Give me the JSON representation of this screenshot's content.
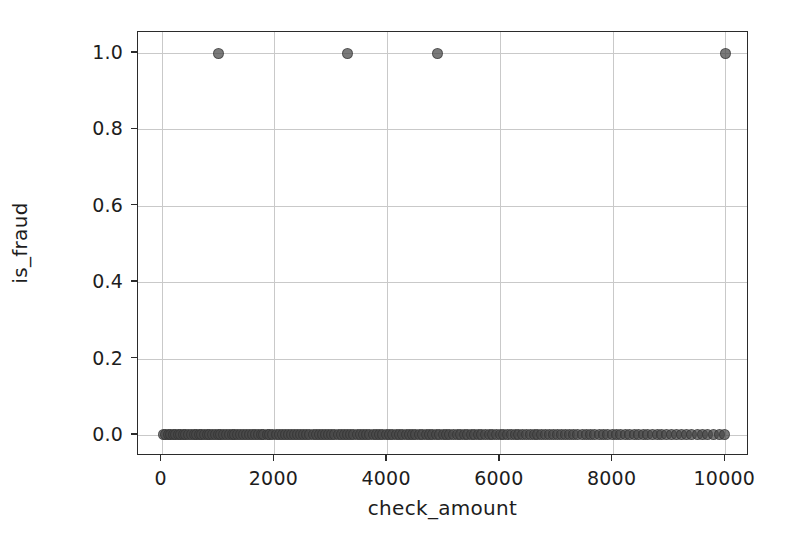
{
  "chart_data": {
    "type": "scatter",
    "title": "",
    "xlabel": "check_amount",
    "ylabel": "is_fraud",
    "xlim": [
      -420,
      10420
    ],
    "ylim": [
      -0.055,
      1.055
    ],
    "xticks": [
      0,
      2000,
      4000,
      6000,
      8000,
      10000
    ],
    "xticklabels": [
      "0",
      "2000",
      "4000",
      "6000",
      "8000",
      "10000"
    ],
    "yticks": [
      0.0,
      0.2,
      0.4,
      0.6,
      0.8,
      1.0
    ],
    "yticklabels": [
      "0.0",
      "0.2",
      "0.4",
      "0.6",
      "0.8",
      "1.0"
    ],
    "grid": true,
    "legend": null,
    "marker": {
      "shape": "circle",
      "size_px": 11,
      "color": "#464646",
      "edge_color": "#2d2d2d",
      "alpha": 0.72
    },
    "series": [
      {
        "name": "is_fraud = 1",
        "points": [
          {
            "x": 1000,
            "y": 1.0
          },
          {
            "x": 3300,
            "y": 1.0
          },
          {
            "x": 4900,
            "y": 1.0
          },
          {
            "x": 10000,
            "y": 1.0
          }
        ]
      },
      {
        "name": "is_fraud = 0",
        "points": [
          {
            "x": 30,
            "y": 0.0
          },
          {
            "x": 75,
            "y": 0.0
          },
          {
            "x": 115,
            "y": 0.0
          },
          {
            "x": 160,
            "y": 0.0
          },
          {
            "x": 205,
            "y": 0.0
          },
          {
            "x": 250,
            "y": 0.0
          },
          {
            "x": 295,
            "y": 0.0
          },
          {
            "x": 340,
            "y": 0.0
          },
          {
            "x": 385,
            "y": 0.0
          },
          {
            "x": 430,
            "y": 0.0
          },
          {
            "x": 480,
            "y": 0.0
          },
          {
            "x": 530,
            "y": 0.0
          },
          {
            "x": 575,
            "y": 0.0
          },
          {
            "x": 620,
            "y": 0.0
          },
          {
            "x": 665,
            "y": 0.0
          },
          {
            "x": 710,
            "y": 0.0
          },
          {
            "x": 760,
            "y": 0.0
          },
          {
            "x": 805,
            "y": 0.0
          },
          {
            "x": 855,
            "y": 0.0
          },
          {
            "x": 900,
            "y": 0.0
          },
          {
            "x": 950,
            "y": 0.0
          },
          {
            "x": 1000,
            "y": 0.0
          },
          {
            "x": 1050,
            "y": 0.0
          },
          {
            "x": 1100,
            "y": 0.0
          },
          {
            "x": 1155,
            "y": 0.0
          },
          {
            "x": 1205,
            "y": 0.0
          },
          {
            "x": 1255,
            "y": 0.0
          },
          {
            "x": 1300,
            "y": 0.0
          },
          {
            "x": 1350,
            "y": 0.0
          },
          {
            "x": 1400,
            "y": 0.0
          },
          {
            "x": 1455,
            "y": 0.0
          },
          {
            "x": 1505,
            "y": 0.0
          },
          {
            "x": 1560,
            "y": 0.0
          },
          {
            "x": 1610,
            "y": 0.0
          },
          {
            "x": 1660,
            "y": 0.0
          },
          {
            "x": 1710,
            "y": 0.0
          },
          {
            "x": 1765,
            "y": 0.0
          },
          {
            "x": 1815,
            "y": 0.0
          },
          {
            "x": 1870,
            "y": 0.0
          },
          {
            "x": 1920,
            "y": 0.0
          },
          {
            "x": 1975,
            "y": 0.0
          },
          {
            "x": 2030,
            "y": 0.0
          },
          {
            "x": 2085,
            "y": 0.0
          },
          {
            "x": 2135,
            "y": 0.0
          },
          {
            "x": 2190,
            "y": 0.0
          },
          {
            "x": 2245,
            "y": 0.0
          },
          {
            "x": 2300,
            "y": 0.0
          },
          {
            "x": 2355,
            "y": 0.0
          },
          {
            "x": 2410,
            "y": 0.0
          },
          {
            "x": 2465,
            "y": 0.0
          },
          {
            "x": 2520,
            "y": 0.0
          },
          {
            "x": 2575,
            "y": 0.0
          },
          {
            "x": 2630,
            "y": 0.0
          },
          {
            "x": 2685,
            "y": 0.0
          },
          {
            "x": 2740,
            "y": 0.0
          },
          {
            "x": 2795,
            "y": 0.0
          },
          {
            "x": 2850,
            "y": 0.0
          },
          {
            "x": 2905,
            "y": 0.0
          },
          {
            "x": 2960,
            "y": 0.0
          },
          {
            "x": 3020,
            "y": 0.0
          },
          {
            "x": 3075,
            "y": 0.0
          },
          {
            "x": 3130,
            "y": 0.0
          },
          {
            "x": 3185,
            "y": 0.0
          },
          {
            "x": 3240,
            "y": 0.0
          },
          {
            "x": 3300,
            "y": 0.0
          },
          {
            "x": 3355,
            "y": 0.0
          },
          {
            "x": 3410,
            "y": 0.0
          },
          {
            "x": 3470,
            "y": 0.0
          },
          {
            "x": 3525,
            "y": 0.0
          },
          {
            "x": 3580,
            "y": 0.0
          },
          {
            "x": 3640,
            "y": 0.0
          },
          {
            "x": 3695,
            "y": 0.0
          },
          {
            "x": 3755,
            "y": 0.0
          },
          {
            "x": 3810,
            "y": 0.0
          },
          {
            "x": 3870,
            "y": 0.0
          },
          {
            "x": 3925,
            "y": 0.0
          },
          {
            "x": 3985,
            "y": 0.0
          },
          {
            "x": 4040,
            "y": 0.0
          },
          {
            "x": 4100,
            "y": 0.0
          },
          {
            "x": 4160,
            "y": 0.0
          },
          {
            "x": 4215,
            "y": 0.0
          },
          {
            "x": 4275,
            "y": 0.0
          },
          {
            "x": 4335,
            "y": 0.0
          },
          {
            "x": 4395,
            "y": 0.0
          },
          {
            "x": 4450,
            "y": 0.0
          },
          {
            "x": 4510,
            "y": 0.0
          },
          {
            "x": 4570,
            "y": 0.0
          },
          {
            "x": 4630,
            "y": 0.0
          },
          {
            "x": 4690,
            "y": 0.0
          },
          {
            "x": 4750,
            "y": 0.0
          },
          {
            "x": 4810,
            "y": 0.0
          },
          {
            "x": 4870,
            "y": 0.0
          },
          {
            "x": 4930,
            "y": 0.0
          },
          {
            "x": 4995,
            "y": 0.0
          },
          {
            "x": 5055,
            "y": 0.0
          },
          {
            "x": 5115,
            "y": 0.0
          },
          {
            "x": 5175,
            "y": 0.0
          },
          {
            "x": 5240,
            "y": 0.0
          },
          {
            "x": 5300,
            "y": 0.0
          },
          {
            "x": 5365,
            "y": 0.0
          },
          {
            "x": 5425,
            "y": 0.0
          },
          {
            "x": 5490,
            "y": 0.0
          },
          {
            "x": 5550,
            "y": 0.0
          },
          {
            "x": 5615,
            "y": 0.0
          },
          {
            "x": 5680,
            "y": 0.0
          },
          {
            "x": 5745,
            "y": 0.0
          },
          {
            "x": 5810,
            "y": 0.0
          },
          {
            "x": 5875,
            "y": 0.0
          },
          {
            "x": 5940,
            "y": 0.0
          },
          {
            "x": 6005,
            "y": 0.0
          },
          {
            "x": 6070,
            "y": 0.0
          },
          {
            "x": 6135,
            "y": 0.0
          },
          {
            "x": 6200,
            "y": 0.0
          },
          {
            "x": 6270,
            "y": 0.0
          },
          {
            "x": 6335,
            "y": 0.0
          },
          {
            "x": 6400,
            "y": 0.0
          },
          {
            "x": 6470,
            "y": 0.0
          },
          {
            "x": 6540,
            "y": 0.0
          },
          {
            "x": 6610,
            "y": 0.0
          },
          {
            "x": 6675,
            "y": 0.0
          },
          {
            "x": 6745,
            "y": 0.0
          },
          {
            "x": 6815,
            "y": 0.0
          },
          {
            "x": 6885,
            "y": 0.0
          },
          {
            "x": 6955,
            "y": 0.0
          },
          {
            "x": 7025,
            "y": 0.0
          },
          {
            "x": 7100,
            "y": 0.0
          },
          {
            "x": 7170,
            "y": 0.0
          },
          {
            "x": 7240,
            "y": 0.0
          },
          {
            "x": 7315,
            "y": 0.0
          },
          {
            "x": 7385,
            "y": 0.0
          },
          {
            "x": 7460,
            "y": 0.0
          },
          {
            "x": 7535,
            "y": 0.0
          },
          {
            "x": 7610,
            "y": 0.0
          },
          {
            "x": 7685,
            "y": 0.0
          },
          {
            "x": 7760,
            "y": 0.0
          },
          {
            "x": 7835,
            "y": 0.0
          },
          {
            "x": 7910,
            "y": 0.0
          },
          {
            "x": 7990,
            "y": 0.0
          },
          {
            "x": 8065,
            "y": 0.0
          },
          {
            "x": 8145,
            "y": 0.0
          },
          {
            "x": 8225,
            "y": 0.0
          },
          {
            "x": 8300,
            "y": 0.0
          },
          {
            "x": 8380,
            "y": 0.0
          },
          {
            "x": 8460,
            "y": 0.0
          },
          {
            "x": 8545,
            "y": 0.0
          },
          {
            "x": 8625,
            "y": 0.0
          },
          {
            "x": 8710,
            "y": 0.0
          },
          {
            "x": 8790,
            "y": 0.0
          },
          {
            "x": 8875,
            "y": 0.0
          },
          {
            "x": 8960,
            "y": 0.0
          },
          {
            "x": 9050,
            "y": 0.0
          },
          {
            "x": 9135,
            "y": 0.0
          },
          {
            "x": 9225,
            "y": 0.0
          },
          {
            "x": 9315,
            "y": 0.0
          },
          {
            "x": 9405,
            "y": 0.0
          },
          {
            "x": 9500,
            "y": 0.0
          },
          {
            "x": 9595,
            "y": 0.0
          },
          {
            "x": 9690,
            "y": 0.0
          },
          {
            "x": 9790,
            "y": 0.0
          },
          {
            "x": 9890,
            "y": 0.0
          },
          {
            "x": 9990,
            "y": 0.0
          }
        ]
      }
    ]
  },
  "style": {
    "background": "#ffffff",
    "grid_color": "#c9c9c9",
    "spine_color": "#2b2b2b",
    "text_color": "#1d1d1d"
  }
}
